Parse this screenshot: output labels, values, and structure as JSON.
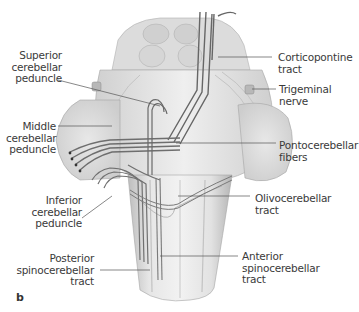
{
  "figure": {
    "panel_letter": "b",
    "colors": {
      "tissue_light": "#ececec",
      "tissue_mid": "#d2d2d2",
      "tissue_dark": "#a8a8a8",
      "tract": "#7a7a7a",
      "tract_dark": "#444444",
      "leader_line": "#555555",
      "label_text": "#3a3a3a"
    },
    "labels_left": [
      {
        "id": "superior-cerebellar-peduncle",
        "text": "Superior\ncerebellar\npeduncle"
      },
      {
        "id": "middle-cerebellar-peduncle",
        "text": "Middle\ncerebellar\npeduncle"
      },
      {
        "id": "inferior-cerebellar-peduncle",
        "text": "Inferior\ncerebellar\npeduncle"
      },
      {
        "id": "posterior-spinocerebellar-tract",
        "text": "Posterior\nspinocerebellar\ntract"
      }
    ],
    "labels_right": [
      {
        "id": "corticopontine-tract",
        "text": "Corticopontine\ntract"
      },
      {
        "id": "trigeminal-nerve",
        "text": "Trigeminal\nnerve"
      },
      {
        "id": "pontocerebellar-fibers",
        "text": "Pontocerebellar\nfibers"
      },
      {
        "id": "olivocerebellar-tract",
        "text": "Olivocerebellar\ntract"
      },
      {
        "id": "anterior-spinocerebellar-tract",
        "text": "Anterior\nspinocerebellar\ntract"
      }
    ]
  }
}
